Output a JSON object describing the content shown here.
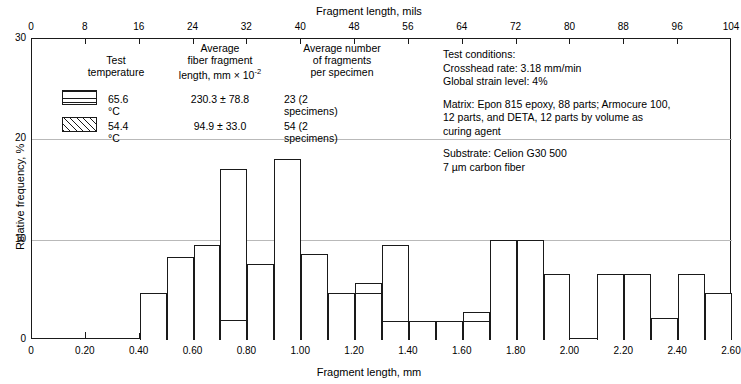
{
  "chart_data": {
    "type": "bar",
    "title": "",
    "xlabel": "Fragment length, mm",
    "ylabel": "Relative frequency, %",
    "xlabel_top": "Fragment length, mils",
    "xlim": [
      0,
      2.6
    ],
    "ylim": [
      0,
      30
    ],
    "xlim_top": [
      0,
      104
    ],
    "grid": true,
    "bin_width": 0.1,
    "xticks": [
      "0",
      "0.20",
      "0.40",
      "0.60",
      "0.80",
      "1.00",
      "1.20",
      "1.40",
      "1.60",
      "1.80",
      "2.00",
      "2.20",
      "2.40",
      "2.60"
    ],
    "xticks_top": [
      "0",
      "8",
      "16",
      "24",
      "32",
      "40",
      "48",
      "56",
      "64",
      "72",
      "80",
      "88",
      "96",
      "104"
    ],
    "yticks": [
      "0",
      "10",
      "20",
      "30"
    ],
    "series": [
      {
        "name": "65.6 °C",
        "pattern": "horizontal-hatch",
        "bins": [
          {
            "x0": 1.2,
            "x1": 1.3,
            "value": 4.7
          },
          {
            "x0": 1.3,
            "x1": 1.4,
            "value": 1.9
          },
          {
            "x0": 1.4,
            "x1": 1.5,
            "value": 1.9
          },
          {
            "x0": 1.5,
            "x1": 1.6,
            "value": 1.9
          },
          {
            "x0": 1.6,
            "x1": 1.7,
            "value": 1.9
          },
          {
            "x0": 1.7,
            "x1": 1.8,
            "value": 10.0
          },
          {
            "x0": 1.8,
            "x1": 1.9,
            "value": 10.0
          },
          {
            "x0": 1.9,
            "x1": 2.0,
            "value": 6.6
          },
          {
            "x0": 2.1,
            "x1": 2.2,
            "value": 6.6
          },
          {
            "x0": 2.2,
            "x1": 2.3,
            "value": 6.6
          },
          {
            "x0": 2.3,
            "x1": 2.4,
            "value": 2.2
          },
          {
            "x0": 2.4,
            "x1": 2.5,
            "value": 6.6
          },
          {
            "x0": 2.5,
            "x1": 2.6,
            "value": 4.7
          },
          {
            "x0": 0.7,
            "x1": 0.8,
            "value": 2.0
          }
        ]
      },
      {
        "name": "54.4 °C",
        "pattern": "diagonal-hatch",
        "bins": [
          {
            "x0": 0.4,
            "x1": 0.5,
            "value": 4.7
          },
          {
            "x0": 0.5,
            "x1": 0.6,
            "value": 8.3
          },
          {
            "x0": 0.6,
            "x1": 0.7,
            "value": 9.5
          },
          {
            "x0": 0.7,
            "x1": 0.8,
            "value": 17.0
          },
          {
            "x0": 0.8,
            "x1": 0.9,
            "value": 7.6
          },
          {
            "x0": 0.9,
            "x1": 1.0,
            "value": 18.0
          },
          {
            "x0": 1.0,
            "x1": 1.1,
            "value": 8.6
          },
          {
            "x0": 1.1,
            "x1": 1.2,
            "value": 4.7
          },
          {
            "x0": 1.2,
            "x1": 1.3,
            "value": 5.7
          },
          {
            "x0": 1.3,
            "x1": 1.4,
            "value": 9.5
          },
          {
            "x0": 1.5,
            "x1": 1.6,
            "value": 0.9
          },
          {
            "x0": 1.6,
            "x1": 1.7,
            "value": 2.8
          },
          {
            "x0": 1.7,
            "x1": 1.8,
            "value": 1.8
          }
        ]
      }
    ]
  },
  "legend": {
    "headers": {
      "col1_l1": "Test",
      "col1_l2": "temperature",
      "col2_l1": "Average",
      "col2_l2": "fiber fragment",
      "col2_l3_a": "length, mm × 10",
      "col2_l3_sup": "-2",
      "col3_l1": "Average number",
      "col3_l2": "of fragments",
      "col3_l3": "per specimen"
    },
    "rows": [
      {
        "temp": "65.6 °C",
        "avg_length": "230.3 ± 78.8",
        "avg_fragments": "23  (2 specimens)",
        "pattern": "horizontal-hatch"
      },
      {
        "temp": "54.4 °C",
        "avg_length": "94.9 ± 33.0",
        "avg_fragments": "54 (2 specimens)",
        "pattern": "diagonal-hatch"
      }
    ]
  },
  "notes": {
    "block1": {
      "line1": "Test conditions:",
      "line2": "Crosshead rate: 3.18 mm/min",
      "line3": "Global strain level: 4%"
    },
    "block2": {
      "line1": "Matrix: Epon 815 epoxy, 88 parts; Armocure 100,",
      "line2": "12 parts, and DETA, 12 parts by volume as",
      "line3": "curing agent"
    },
    "block3": {
      "line1": "Substrate: Celion G30 500",
      "line2": "7 µm carbon fiber"
    }
  },
  "colors": {
    "axis": "#1a1a1a",
    "grid": "#b9b9b9",
    "hatch": "#1a1a1a",
    "background": "#ffffff"
  }
}
